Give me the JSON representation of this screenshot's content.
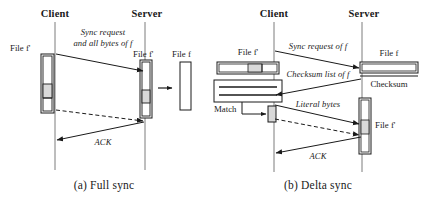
{
  "figure": {
    "name": "rsync-full-vs-delta-sync-sequence-diagrams",
    "background": "#ffffff",
    "line_color": "#1a1a1a",
    "shade_color": "#d9d9d9"
  },
  "panel_a": {
    "caption": "(a) Full sync",
    "lifelines": {
      "client": "Client",
      "server": "Server"
    },
    "objects": {
      "client_file": "File f'",
      "server_file_old": "File f'",
      "server_file_new": "File f"
    },
    "messages": [
      {
        "line1": "Sync request",
        "line2": "and all bytes of f"
      },
      {
        "line1": "ACK",
        "line2": ""
      }
    ]
  },
  "panel_b": {
    "caption": "(b) Delta sync",
    "lifelines": {
      "client": "Client",
      "server": "Server"
    },
    "objects": {
      "client_file": "File f'",
      "match": "Match",
      "server_file": "File f",
      "server_checksum": "Checksum",
      "server_file_new": "File f'"
    },
    "messages": [
      {
        "label": "Sync request of f"
      },
      {
        "label": "Checksum list of f"
      },
      {
        "label": "Literal bytes"
      },
      {
        "label": "ACK"
      }
    ]
  }
}
